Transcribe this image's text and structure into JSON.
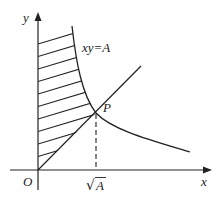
{
  "diagram": {
    "axis_labels": {
      "x": "x",
      "y": "y",
      "origin": "O"
    },
    "curve_label": "xy=A",
    "point_label": "P",
    "tick_label_radical": "√",
    "tick_label_value": "A",
    "elements": [
      "x-axis with arrow",
      "y-axis with arrow",
      "hyperbola xy=A",
      "line y=x through origin",
      "intersection point P",
      "dashed vertical from P to x-axis at √A",
      "hatched region between y-axis, line y=x and hyperbola"
    ],
    "colors": {
      "stroke": "#222222",
      "background": "#ffffff"
    }
  }
}
